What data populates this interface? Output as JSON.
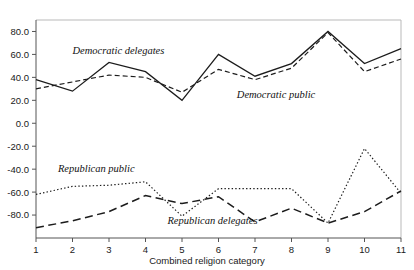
{
  "chart_data": {
    "type": "line",
    "title": "",
    "xlabel": "Combined religion category",
    "ylabel": "",
    "x": [
      1,
      2,
      3,
      4,
      5,
      6,
      7,
      8,
      9,
      10,
      11
    ],
    "categories": [
      "1",
      "2",
      "3",
      "4",
      "5",
      "6",
      "7",
      "8",
      "9",
      "10",
      "11"
    ],
    "xlim": [
      1,
      11
    ],
    "ylim": [
      -100,
      90
    ],
    "ytick_labels": [
      "80.0",
      "60.0",
      "40.0",
      "20.0",
      "0.0",
      "-20.0",
      "-40.0",
      "-60.0",
      "-80.0"
    ],
    "ytick_values": [
      80,
      60,
      40,
      20,
      0,
      -20,
      -40,
      -60,
      -80
    ],
    "grid": false,
    "legend": "inline-annotations",
    "series": [
      {
        "name": "Democratic delegates",
        "style": "solid",
        "label_x": 2.0,
        "label_y": 60,
        "values": [
          38,
          28,
          53,
          45,
          20,
          60,
          41,
          52,
          80,
          52,
          65
        ]
      },
      {
        "name": "Democratic public",
        "style": "dashed",
        "label_x": 6.5,
        "label_y": 22,
        "values": [
          30,
          36,
          42,
          40,
          27,
          47,
          38,
          48,
          79,
          45,
          56
        ]
      },
      {
        "name": "Republican public",
        "style": "dotted",
        "label_x": 1.6,
        "label_y": -42,
        "values": [
          -62,
          -55,
          -54,
          -51,
          -81,
          -57,
          -57,
          -57,
          -87,
          -22,
          -61
        ]
      },
      {
        "name": "Republican delegates",
        "style": "long-dashed",
        "label_x": 4.6,
        "label_y": -88,
        "values": [
          -91,
          -85,
          -77,
          -63,
          -70,
          -64,
          -86,
          -74,
          -87,
          -77,
          -59
        ]
      }
    ]
  }
}
